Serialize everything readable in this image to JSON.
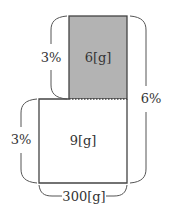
{
  "diagram": {
    "type": "mixing-area-diagram",
    "colors": {
      "shaded_fill": "#b3b3b3",
      "stroke": "#444444",
      "text": "#333333",
      "background": "#ffffff"
    },
    "upper_box": {
      "label": "6[g]",
      "percent_label": "3%",
      "shaded": true
    },
    "lower_box": {
      "label": "9[g]",
      "percent_label": "3%",
      "shaded": false
    },
    "total_percent_label": "6%",
    "width_label": "300[g]"
  }
}
